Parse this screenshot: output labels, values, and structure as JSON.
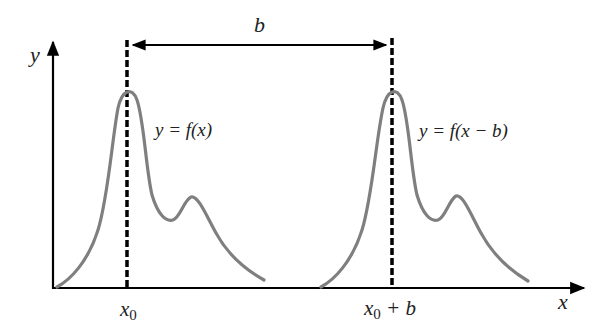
{
  "diagram": {
    "type": "function-translation",
    "axes": {
      "x_label": "x",
      "y_label": "y"
    },
    "shift": {
      "label": "b"
    },
    "curves": [
      {
        "label": "y = f(x)",
        "label_parts": [
          "y = f(x)"
        ],
        "peak_marker": "x",
        "peak_marker_sub": "0",
        "peak_marker_suffix": ""
      },
      {
        "label": "y = f(x − b)",
        "label_parts": [
          "y = f(x − b)"
        ],
        "peak_marker": "x",
        "peak_marker_sub": "0",
        "peak_marker_suffix": " + b"
      }
    ],
    "colors": {
      "curve": "#7f7f7f",
      "axis": "#000000",
      "dashed_line": "#000000",
      "text": "#222222",
      "background": "#ffffff"
    }
  }
}
